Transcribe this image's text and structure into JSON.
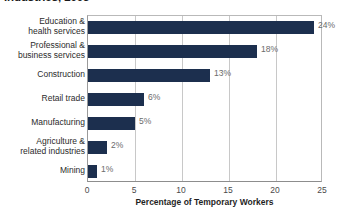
{
  "chart_data": {
    "type": "bar",
    "orientation": "horizontal",
    "title": "Industries, 2005",
    "xlabel": "Percentage of Temporary Workers",
    "ylabel": "",
    "xlim": [
      0,
      25
    ],
    "xticks": [
      "0",
      "5",
      "10",
      "15",
      "20",
      "25"
    ],
    "grid": true,
    "legend": false,
    "bar_color": "#1c2f4e",
    "categories": [
      "Education &\nhealth services",
      "Professional &\nbusiness services",
      "Construction",
      "Retail trade",
      "Manufacturing",
      "Agriculture &\nrelated industries",
      "Mining"
    ],
    "values": [
      24,
      18,
      13,
      6,
      5,
      2,
      1
    ],
    "value_labels": [
      "24%",
      "18%",
      "13%",
      "6%",
      "5%",
      "2%",
      "1%"
    ]
  }
}
